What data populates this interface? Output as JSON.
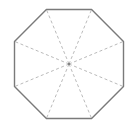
{
  "diagram": {
    "shape": "regular octagon",
    "sides": 8,
    "spokes": "dashed segments from center to each vertex",
    "center_marker": true,
    "colors": {
      "outline": "#7a7a7a",
      "spoke": "#a8a8a8",
      "center": "#777777",
      "background": "#ffffff"
    }
  }
}
